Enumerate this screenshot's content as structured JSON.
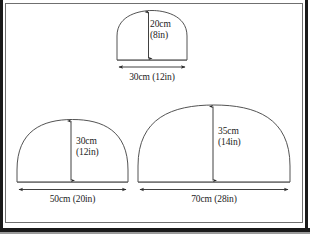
{
  "figure": {
    "title": "",
    "background_color": "#ffffff",
    "line_color": "#3a3a3a",
    "text_color": "#1b1b1b",
    "frame_color": "#1a1a1a"
  },
  "shapes": [
    {
      "id": "top-arch",
      "name": "small-arch",
      "height_label_line1": "20cm",
      "height_label_line2": "(8in)",
      "width_label": "30cm (12in)",
      "height_cm": 20,
      "height_in": 8,
      "width_cm": 30,
      "width_in": 12
    },
    {
      "id": "bottom-left-dome",
      "name": "medium-dome",
      "height_label_line1": "30cm",
      "height_label_line2": "(12in)",
      "width_label": "50cm (20in)",
      "height_cm": 30,
      "height_in": 12,
      "width_cm": 50,
      "width_in": 20
    },
    {
      "id": "bottom-right-dome",
      "name": "large-dome",
      "height_label_line1": "35cm",
      "height_label_line2": "(14in)",
      "width_label": "70cm (28in)",
      "height_cm": 35,
      "height_in": 14,
      "width_cm": 70,
      "width_in": 28
    }
  ],
  "labels": {
    "top_height_line1": "20cm",
    "top_height_line2": "(8in)",
    "top_width": "30cm (12in)",
    "left_height_line1": "30cm",
    "left_height_line2": "(12in)",
    "left_width": "50cm (20in)",
    "right_height_line1": "35cm",
    "right_height_line2": "(14in)",
    "right_width": "70cm (28in)"
  },
  "icons": {
    "vertical_dimension_arrow": "double-headed-vertical-arrow-icon",
    "horizontal_dimension_arrow": "double-headed-horizontal-arrow-icon"
  }
}
